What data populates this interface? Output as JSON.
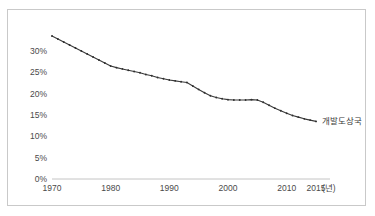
{
  "chart_data": {
    "type": "line",
    "title": "",
    "subtitle": "",
    "xlabel": "",
    "ylabel": "",
    "unit_label": "(년)",
    "grid": false,
    "legend_position": "inline-right-end",
    "xlim": [
      1970,
      2015
    ],
    "ylim": [
      0,
      30
    ],
    "xtick_labels": [
      "1970",
      "1980",
      "1990",
      "2000",
      "2010",
      "2015"
    ],
    "xtick_values": [
      1970,
      1980,
      1990,
      2000,
      2010,
      2015
    ],
    "ytick_labels": [
      "0%",
      "5%",
      "10%",
      "15%",
      "20%",
      "25%",
      "30%"
    ],
    "ytick_values": [
      0,
      5,
      10,
      15,
      20,
      25,
      30
    ],
    "series": [
      {
        "name": "개발도상국",
        "color": "#3a3a3a",
        "x": [
          1970,
          1971,
          1972,
          1973,
          1974,
          1975,
          1976,
          1977,
          1978,
          1979,
          1980,
          1981,
          1982,
          1983,
          1984,
          1985,
          1986,
          1987,
          1988,
          1989,
          1990,
          1991,
          1992,
          1993,
          1994,
          1995,
          1996,
          1997,
          1998,
          1999,
          2000,
          2001,
          2002,
          2003,
          2004,
          2005,
          2006,
          2007,
          2008,
          2009,
          2010,
          2011,
          2012,
          2013,
          2014,
          2015
        ],
        "values": [
          33.5,
          32.8,
          32.1,
          31.4,
          30.7,
          30.0,
          29.3,
          28.6,
          27.9,
          27.2,
          26.5,
          26.1,
          25.8,
          25.5,
          25.2,
          24.9,
          24.5,
          24.2,
          23.8,
          23.5,
          23.2,
          23.0,
          22.8,
          22.6,
          21.8,
          21.0,
          20.2,
          19.5,
          19.1,
          18.8,
          18.6,
          18.5,
          18.5,
          18.5,
          18.6,
          18.5,
          18.0,
          17.3,
          16.6,
          16.0,
          15.4,
          14.9,
          14.5,
          14.1,
          13.8,
          13.5
        ]
      }
    ],
    "annotations": [
      {
        "text": "개발도상국",
        "x": 2015,
        "y": 13.5,
        "placement": "right"
      }
    ]
  },
  "axis": {
    "y_labels": [
      "30%",
      "25%",
      "20%",
      "15%",
      "10%",
      "5%",
      "0%"
    ],
    "x_labels": [
      "1970",
      "1980",
      "1990",
      "2000",
      "2010",
      "2015"
    ],
    "unit": "(년)"
  }
}
